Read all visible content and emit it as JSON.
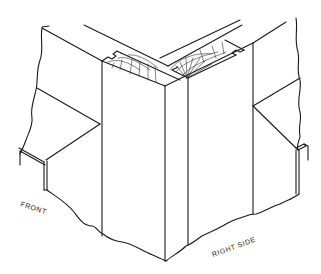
{
  "figure": {
    "labels": {
      "front": "FRONT",
      "right_side": "RIGHT SIDE"
    },
    "colors": {
      "background": "#ffffff",
      "ink": "#1a1a1a"
    }
  }
}
